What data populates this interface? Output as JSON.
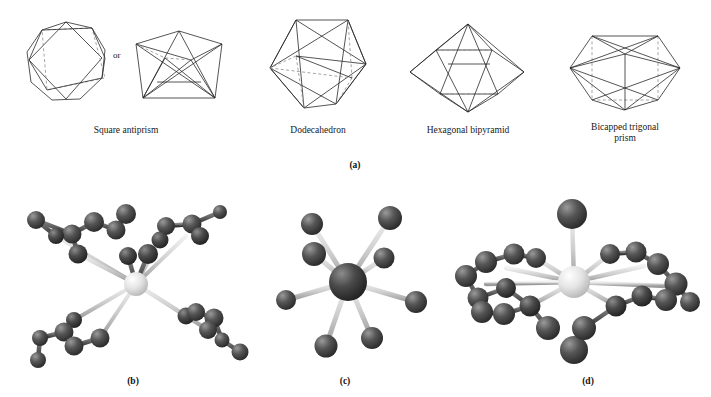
{
  "figure": {
    "type": "chemistry-coordination-geometry-figure",
    "panels": [
      {
        "id": "a",
        "label": "(a)",
        "caption": "Idealised eight-coordinate polyhedra"
      },
      {
        "id": "b",
        "label": "(b)",
        "caption": "Square antiprismatic complex with four chelating ligands"
      },
      {
        "id": "c",
        "label": "(c)",
        "caption": "Eight-coordinate complex with monodentate ligands"
      },
      {
        "id": "d",
        "label": "(d)",
        "caption": "Hexagonal bipyramidal complex with chelating ligands"
      }
    ]
  },
  "polyhedra": {
    "connector": "or",
    "items": [
      {
        "name": "square-antiprism",
        "label": "Square antiprism",
        "views": 2
      },
      {
        "name": "dodecahedron",
        "label": "Dodecahedron",
        "views": 1
      },
      {
        "name": "hexagonal-bipyramid",
        "label": "Hexagonal bipyramid",
        "views": 1
      },
      {
        "name": "bicapped-trigonal-prism",
        "label_line1": "Bicapped trigonal",
        "label_line2": "prism",
        "views": 1
      }
    ]
  },
  "colors": {
    "line": "#2a2a2a",
    "hidden_line": "#8e8e8e",
    "ligand_dark": "#4a4a4a",
    "ligand_darker": "#3a3a3a",
    "metal_light": "#e2e2e2",
    "metal_dark": "#2e2e2e",
    "bond_light": "#cccccc",
    "bond_dark": "#5a5a5a",
    "background": "#ffffff"
  },
  "molecules": {
    "b": {
      "center_atom_color": "metal_light",
      "coordination_number": 8,
      "ligand_count": 26,
      "chelate_arms": 4
    },
    "c": {
      "center_atom_color": "metal_dark",
      "coordination_number": 8,
      "ligand_count": 8,
      "chelate_arms": 0
    },
    "d": {
      "center_atom_color": "metal_light",
      "coordination_number": 8,
      "ligand_count": 22,
      "chelate_arms": 3
    }
  }
}
